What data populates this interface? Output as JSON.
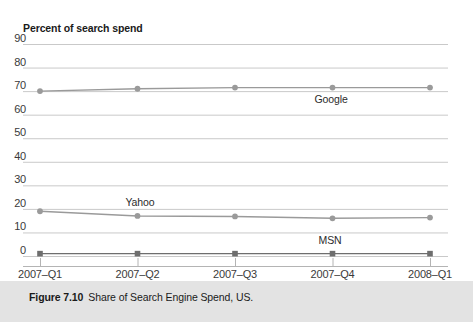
{
  "figure": {
    "caption_label": "Figure 7.10",
    "caption_text": "Share of Search Engine Spend, US.",
    "band_color": "#e3e3e3"
  },
  "chart_data": {
    "type": "line",
    "title": "Percent of search spend",
    "xlabel": "",
    "ylabel": "Percent of search spend",
    "categories": [
      "2007–Q1",
      "2007–Q2",
      "2007–Q3",
      "2007–Q4",
      "2008–Q1"
    ],
    "series": [
      {
        "name": "Google",
        "values": [
          70,
          71,
          71.5,
          71.5,
          71.5
        ],
        "color": "#9a9a9a",
        "marker": "circle",
        "label_position": "below-right"
      },
      {
        "name": "Yahoo",
        "values": [
          19,
          17,
          16.8,
          16,
          16.3
        ],
        "color": "#9a9a9a",
        "marker": "circle",
        "label_position": "above"
      },
      {
        "name": "MSN",
        "values": [
          1,
          1,
          1,
          1,
          1
        ],
        "color": "#6e6e6e",
        "marker": "square",
        "label_position": "above"
      }
    ],
    "ylim": [
      0,
      90
    ],
    "yticks": [
      0,
      10,
      20,
      30,
      40,
      50,
      60,
      70,
      80,
      90
    ],
    "ytick_labels": [
      "0",
      "10",
      "20",
      "30",
      "40",
      "50",
      "60",
      "70",
      "80",
      "90"
    ],
    "grid": true,
    "grid_color": "#c9c9c9",
    "legend": "inline-labels",
    "legend_position": "inline"
  }
}
